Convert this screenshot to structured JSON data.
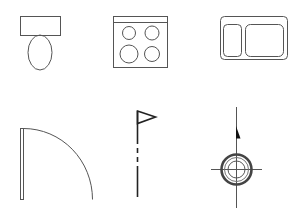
{
  "diagram": {
    "title": "Architectural floor plan symbols",
    "background": "#ffffff",
    "line_color": "#555555",
    "symbols": [
      {
        "id": "toilet",
        "label": "Toilet",
        "row": 1,
        "col": 1
      },
      {
        "id": "stove",
        "label": "Stove / Cooktop (4 burners)",
        "row": 1,
        "col": 2
      },
      {
        "id": "sink",
        "label": "Double Sink",
        "row": 1,
        "col": 3
      },
      {
        "id": "door",
        "label": "Door Swing",
        "row": 2,
        "col": 1
      },
      {
        "id": "flag",
        "label": "Flag / Survey Marker",
        "row": 2,
        "col": 2
      },
      {
        "id": "north",
        "label": "North Arrow / Benchmark",
        "row": 2,
        "col": 3
      }
    ]
  }
}
